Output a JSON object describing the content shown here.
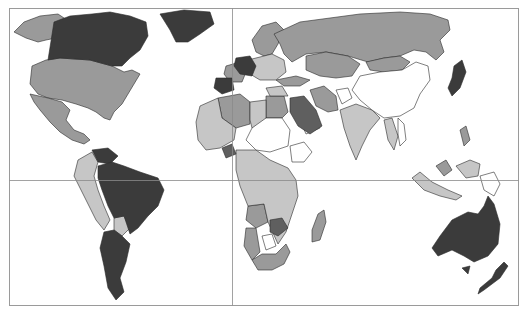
{
  "map": {
    "type": "choropleth",
    "projection": "world, equirectangular-like",
    "frame": {
      "x": 9,
      "y": 8,
      "width": 509,
      "height": 297,
      "stroke": "#9a9a9a"
    },
    "graticule": {
      "equator_y": 180,
      "prime_meridian_x": 232,
      "stroke": "#8a8a8a"
    },
    "background": "#ffffff",
    "classes": [
      {
        "id": "c5",
        "fill": "#3b3b3b",
        "description": "darkest"
      },
      {
        "id": "c4",
        "fill": "#5f5f5f",
        "description": "dark"
      },
      {
        "id": "c3",
        "fill": "#9a9a9a",
        "description": "medium"
      },
      {
        "id": "c2",
        "fill": "#c6c6c6",
        "description": "light"
      },
      {
        "id": "c1",
        "fill": "#ffffff",
        "description": "lightest"
      }
    ],
    "regions": {
      "c5": [
        "Canada",
        "Greenland",
        "Germany",
        "Spain",
        "Venezuela",
        "Brazil",
        "Argentina",
        "Chile",
        "Australia",
        "New Zealand",
        "Japan",
        "Saudi Arabia"
      ],
      "c4": [
        "Guyana",
        "Zimbabwe",
        "Mali region",
        "Ukraine"
      ],
      "c3": [
        "Alaska",
        "United States",
        "Mexico",
        "Russia",
        "Kazakhstan",
        "Mongolia",
        "France",
        "Nordic countries",
        "Iran",
        "Turkey",
        "Egypt",
        "Algeria",
        "Angola",
        "Namibia",
        "South Africa",
        "Madagascar",
        "Malaysia",
        "Philippines"
      ],
      "c2": [
        "Colombia",
        "Peru",
        "Bolivia",
        "Paraguay",
        "India",
        "Libya",
        "Morocco",
        "Western Africa",
        "DR Congo",
        "Tanzania",
        "Zambia",
        "Mozambique",
        "Indonesia",
        "Thailand"
      ],
      "c1": [
        "China",
        "Afghanistan",
        "Yemen",
        "Sudan",
        "Ethiopia",
        "Niger",
        "Chad",
        "Cuba",
        "Central America",
        "Papua New Guinea",
        "Botswana",
        "Vietnam"
      ]
    }
  }
}
